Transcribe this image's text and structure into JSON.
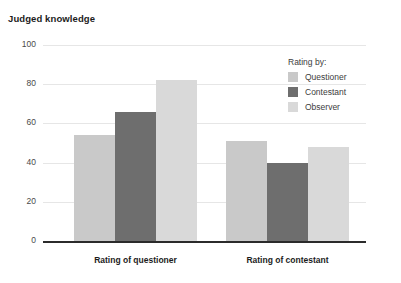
{
  "chart_data": {
    "type": "bar",
    "title": "Judged knowledge",
    "xlabel": "",
    "ylabel": "",
    "ylim": [
      0,
      100
    ],
    "yticks": [
      0,
      20,
      40,
      60,
      80,
      100
    ],
    "grid": true,
    "legend_position": "top-right",
    "legend_title": "Rating by:",
    "categories": [
      "Rating of questioner",
      "Rating of contestant"
    ],
    "series": [
      {
        "name": "Questioner",
        "color": "#c9c9c9",
        "values": [
          54,
          51
        ]
      },
      {
        "name": "Contestant",
        "color": "#6e6e6e",
        "values": [
          66,
          40
        ]
      },
      {
        "name": "Observer",
        "color": "#d9d9d9",
        "values": [
          82,
          48
        ]
      }
    ]
  }
}
